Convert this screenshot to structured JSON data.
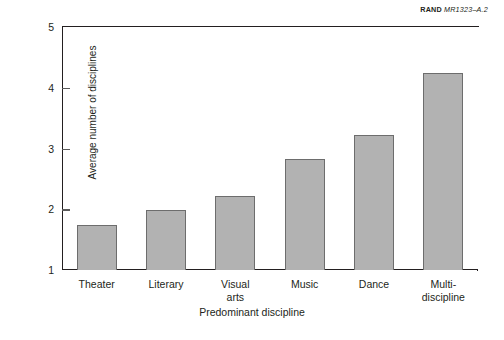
{
  "source_label": {
    "org": "RAND",
    "code": "MR1323–A.2"
  },
  "chart_data": {
    "type": "bar",
    "title": "",
    "xlabel": "Predominant discipline",
    "ylabel": "Average number of disciplines",
    "categories": [
      "Theater",
      "Literary",
      "Visual arts",
      "Music",
      "Dance",
      "Multi-discipline"
    ],
    "category_lines": [
      [
        "Theater"
      ],
      [
        "Literary"
      ],
      [
        "Visual",
        "arts"
      ],
      [
        "Music"
      ],
      [
        "Dance"
      ],
      [
        "Multi-",
        "discipline"
      ]
    ],
    "values": [
      1.74,
      1.98,
      2.22,
      2.82,
      3.22,
      4.24
    ],
    "ylim": [
      1,
      5
    ],
    "yticks": [
      "5",
      "4",
      "3",
      "2",
      "1"
    ],
    "ytick_values": [
      5,
      4,
      3,
      2,
      1
    ],
    "grid": false,
    "legend": null,
    "bar_fill_color": "#b2b2b2",
    "bar_edge_color": "#6d6d6d",
    "axis_color": "#231f20"
  }
}
